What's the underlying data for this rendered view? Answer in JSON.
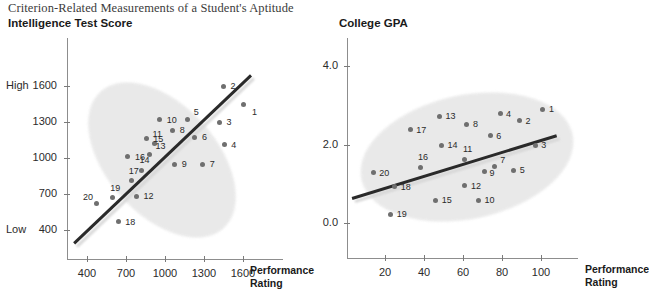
{
  "figure": {
    "title": "Criterion-Related Measurements of a Student's Aptitude"
  },
  "chart_data": [
    {
      "type": "scatter",
      "title": "Intelligence Test Score",
      "xlabel": "Performance Rating",
      "ylabel": "Intelligence Test Score",
      "xlim": [
        280,
        1720
      ],
      "ylim": [
        270,
        1760
      ],
      "xticks": [
        400,
        700,
        1000,
        1300,
        1600
      ],
      "yticks": [
        400,
        700,
        1000,
        1300,
        1600
      ],
      "ytick_side_labels": {
        "top": "High",
        "bottom": "Low"
      },
      "grid": false,
      "legend": "none",
      "trend_line": {
        "x0": 300,
        "y0": 300,
        "x1": 1660,
        "y1": 1700
      },
      "points": [
        {
          "label": "1",
          "x": 1600,
          "y": 1450,
          "lx": 9,
          "ly": 7
        },
        {
          "label": "2",
          "x": 1450,
          "y": 1600,
          "lx": 7,
          "ly": -1
        },
        {
          "label": "3",
          "x": 1420,
          "y": 1300,
          "lx": 7,
          "ly": -1
        },
        {
          "label": "4",
          "x": 1455,
          "y": 1110,
          "lx": 7,
          "ly": -1
        },
        {
          "label": "5",
          "x": 1175,
          "y": 1320,
          "lx": 6,
          "ly": -9
        },
        {
          "label": "6",
          "x": 1230,
          "y": 1175,
          "lx": 7,
          "ly": -1
        },
        {
          "label": "7",
          "x": 1290,
          "y": 950,
          "lx": 7,
          "ly": -1
        },
        {
          "label": "8",
          "x": 1060,
          "y": 1230,
          "lx": 7,
          "ly": -1
        },
        {
          "label": "9",
          "x": 1075,
          "y": 950,
          "lx": 7,
          "ly": -1
        },
        {
          "label": "10",
          "x": 960,
          "y": 1320,
          "lx": 7,
          "ly": -1
        },
        {
          "label": "11",
          "x": 920,
          "y": 1120,
          "lx": -2,
          "ly": -11
        },
        {
          "label": "12",
          "x": 780,
          "y": 680,
          "lx": 7,
          "ly": -1
        },
        {
          "label": "13",
          "x": 880,
          "y": 1030,
          "lx": 6,
          "ly": -9
        },
        {
          "label": "14",
          "x": 820,
          "y": 900,
          "lx": -2,
          "ly": -11
        },
        {
          "label": "15",
          "x": 855,
          "y": 1160,
          "lx": 7,
          "ly": -1
        },
        {
          "label": "16",
          "x": 715,
          "y": 1010,
          "lx": 7,
          "ly": -1
        },
        {
          "label": "17",
          "x": 745,
          "y": 810,
          "lx": -3,
          "ly": -11
        },
        {
          "label": "18",
          "x": 640,
          "y": 470,
          "lx": 7,
          "ly": -1
        },
        {
          "label": "19",
          "x": 595,
          "y": 670,
          "lx": -2,
          "ly": -11
        },
        {
          "label": "20",
          "x": 470,
          "y": 620,
          "lx": -13,
          "ly": -8
        }
      ]
    },
    {
      "type": "scatter",
      "title": "College GPA",
      "xlabel": "Performance Rating",
      "ylabel": "College GPA",
      "xlim": [
        2,
        115
      ],
      "ylim": [
        -0.5,
        4.7
      ],
      "xticks": [
        20,
        40,
        60,
        80,
        100
      ],
      "yticks": [
        0.0,
        2.0,
        4.0
      ],
      "grid": false,
      "legend": "none",
      "trend_line": {
        "x0": 3,
        "y0": 0.65,
        "x1": 108,
        "y1": 2.25
      },
      "points": [
        {
          "label": "1",
          "x": 101,
          "y": 2.9,
          "lx": 6,
          "ly": -1
        },
        {
          "label": "2",
          "x": 89,
          "y": 2.6,
          "lx": 6,
          "ly": -1
        },
        {
          "label": "3",
          "x": 97,
          "y": 1.98,
          "lx": 6,
          "ly": -1
        },
        {
          "label": "4",
          "x": 79,
          "y": 2.78,
          "lx": 6,
          "ly": -1
        },
        {
          "label": "5",
          "x": 86,
          "y": 1.35,
          "lx": 6,
          "ly": -1
        },
        {
          "label": "6",
          "x": 74,
          "y": 2.22,
          "lx": 6,
          "ly": -1
        },
        {
          "label": "7",
          "x": 76,
          "y": 1.45,
          "lx": 6,
          "ly": -7
        },
        {
          "label": "8",
          "x": 62,
          "y": 2.52,
          "lx": 6,
          "ly": -1
        },
        {
          "label": "9",
          "x": 71,
          "y": 1.3,
          "lx": 5,
          "ly": 0
        },
        {
          "label": "10",
          "x": 68,
          "y": 0.58,
          "lx": 6,
          "ly": -1
        },
        {
          "label": "11",
          "x": 61,
          "y": 1.62,
          "lx": -2,
          "ly": -11
        },
        {
          "label": "12",
          "x": 61,
          "y": 0.95,
          "lx": 6,
          "ly": -1
        },
        {
          "label": "13",
          "x": 48,
          "y": 2.72,
          "lx": 6,
          "ly": -1
        },
        {
          "label": "14",
          "x": 49,
          "y": 1.98,
          "lx": 6,
          "ly": -1
        },
        {
          "label": "15",
          "x": 46,
          "y": 0.58,
          "lx": 6,
          "ly": -1
        },
        {
          "label": "16",
          "x": 38,
          "y": 1.42,
          "lx": -2,
          "ly": -11
        },
        {
          "label": "17",
          "x": 33,
          "y": 2.38,
          "lx": 6,
          "ly": -1
        },
        {
          "label": "18",
          "x": 25,
          "y": 0.92,
          "lx": 6,
          "ly": -1
        },
        {
          "label": "19",
          "x": 23,
          "y": 0.22,
          "lx": 6,
          "ly": -1
        },
        {
          "label": "20",
          "x": 14,
          "y": 1.28,
          "lx": 6,
          "ly": -1
        }
      ]
    }
  ]
}
